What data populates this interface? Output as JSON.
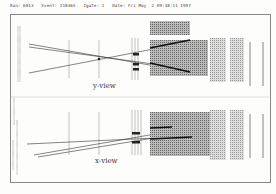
{
  "header": {
    "text": "Run: 6013   Event: 218465   Igate: 1   Date: Fri May  2 09:48:11 1997",
    "run": "6013",
    "event": "218465",
    "igate": "1",
    "date": "Fri May  2 09:48:11 1997"
  },
  "views": [
    {
      "label": "y-view"
    },
    {
      "label": "x-view"
    }
  ],
  "colors": {
    "ink": "#333333",
    "hits": "#777777",
    "background": "#fdfdfb"
  }
}
